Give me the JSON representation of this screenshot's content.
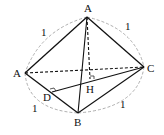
{
  "diagram": {
    "type": "folded-triangle-geometry",
    "points": {
      "A_top": {
        "label": "A",
        "x": 87,
        "y": 17
      },
      "A_left": {
        "label": "A",
        "x": 25,
        "y": 73
      },
      "B": {
        "label": "B",
        "x": 78,
        "y": 113
      },
      "C": {
        "label": "C",
        "x": 144,
        "y": 67
      },
      "D": {
        "label": "D",
        "x": 52,
        "y": 92
      },
      "H": {
        "label": "H",
        "x": 90,
        "y": 79
      }
    },
    "edge_labels": [
      {
        "text": "1",
        "x": 43,
        "y": 36
      },
      {
        "text": "1",
        "x": 127,
        "y": 30
      },
      {
        "text": "1",
        "x": 34,
        "y": 112
      },
      {
        "text": "1",
        "x": 122,
        "y": 108
      }
    ],
    "colors": {
      "line": "#111111",
      "arc": "#999999"
    }
  }
}
